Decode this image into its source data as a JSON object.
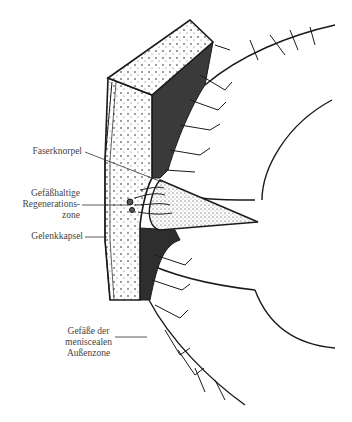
{
  "figure": {
    "colors": {
      "ink": "#1a1a1a",
      "dark_fill": "#3a3a3a",
      "background": "#ffffff",
      "label_text": "#444444"
    }
  },
  "labels": [
    {
      "id": "faserknorpel",
      "lines": [
        "Faserknorpel"
      ]
    },
    {
      "id": "regenerationszone",
      "lines": [
        "Gefäßhaltige",
        "Regenerations-",
        "zone"
      ]
    },
    {
      "id": "gelenkkapsel",
      "lines": [
        "Gelenkkapsel"
      ]
    },
    {
      "id": "aussenzone",
      "lines": [
        "Gefäße der",
        "meniscealen",
        "Außenzone"
      ]
    }
  ]
}
